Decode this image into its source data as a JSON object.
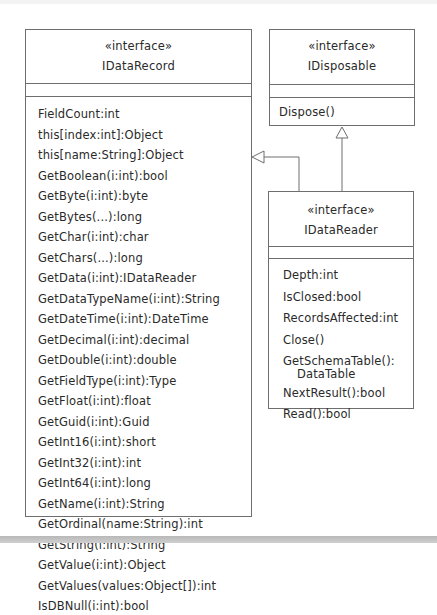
{
  "diagram": {
    "type": "UML class diagram",
    "classes": {
      "idatarecord": {
        "stereotype": "«interface»",
        "name": "IDataRecord",
        "members": [
          "FieldCount:int",
          "this[index:int]:Object",
          "this[name:String]:Object",
          "GetBoolean(i:int):bool",
          "GetByte(i:int):byte",
          "GetBytes(...):long",
          "GetChar(i:int):char",
          "GetChars(...):long",
          "GetData(i:int):IDataReader",
          "GetDataTypeName(i:int):String",
          "GetDateTime(i:int):DateTime",
          "GetDecimal(i:int):decimal",
          "GetDouble(i:int):double",
          "GetFieldType(i:int):Type",
          "GetFloat(i:int):float",
          "GetGuid(i:int):Guid",
          "GetInt16(i:int):short",
          "GetInt32(i:int):int",
          "GetInt64(i:int):long",
          "GetName(i:int):String",
          "GetOrdinal(name:String):int",
          "GetString(i:int):String",
          "GetValue(i:int):Object",
          "GetValues(values:Object[]):int",
          "IsDBNull(i:int):bool"
        ]
      },
      "idisposable": {
        "stereotype": "«interface»",
        "name": "IDisposable",
        "members": [
          "Dispose()"
        ]
      },
      "idatareader": {
        "stereotype": "«interface»",
        "name": "IDataReader",
        "members": [
          "Depth:int",
          "IsClosed:bool",
          "RecordsAffected:int",
          "Close()",
          "GetSchemaTable():",
          "DataTable",
          "NextResult():bool",
          "Read():bool"
        ]
      }
    },
    "relationships": [
      {
        "from": "IDataReader",
        "to": "IDataRecord",
        "kind": "generalization"
      },
      {
        "from": "IDataReader",
        "to": "IDisposable",
        "kind": "generalization"
      }
    ],
    "colors": {
      "line": "#6e6e6e",
      "text": "#2a2a2a",
      "background": "#ffffff"
    }
  }
}
